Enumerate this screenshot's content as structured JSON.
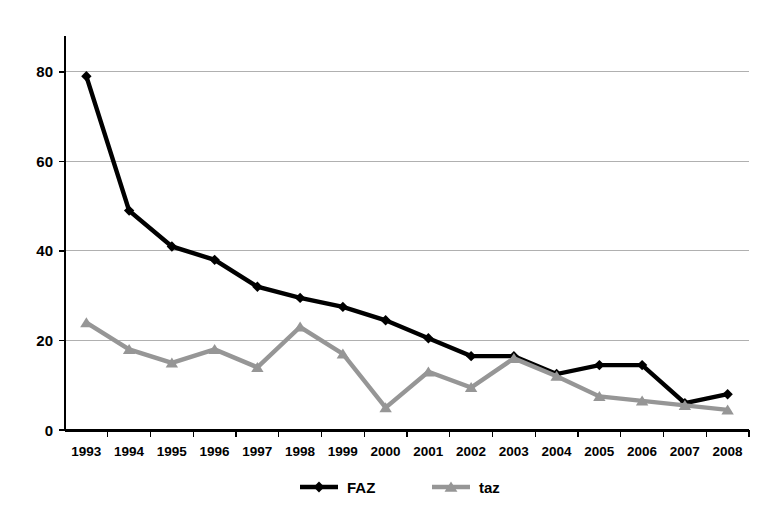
{
  "chart_data": {
    "type": "line",
    "title": "",
    "subtitle": "",
    "xlabel": "",
    "ylabel": "",
    "categories": [
      "1993",
      "1994",
      "1995",
      "1996",
      "1997",
      "1998",
      "1999",
      "2000",
      "2001",
      "2002",
      "2003",
      "2004",
      "2005",
      "2006",
      "2007",
      "2008"
    ],
    "ylim": [
      0,
      88
    ],
    "yticks": [
      0,
      20,
      40,
      60,
      80
    ],
    "ytick_labels": [
      "0",
      "20",
      "40",
      "60",
      "80"
    ],
    "grid": "horizontal",
    "legend_position": "bottom",
    "series": [
      {
        "name": "FAZ",
        "color": "#000000",
        "marker": "diamond",
        "values": [
          79,
          49,
          41,
          38,
          32,
          29.5,
          27.5,
          24.5,
          20.5,
          16.5,
          16.5,
          12.5,
          14.5,
          14.5,
          6,
          8
        ]
      },
      {
        "name": "taz",
        "color": "#969696",
        "marker": "triangle",
        "values": [
          24,
          18,
          15,
          18,
          14,
          23,
          17,
          5,
          13,
          9.5,
          16,
          12,
          7.5,
          6.5,
          5.5,
          4.5
        ]
      }
    ]
  },
  "legend": {
    "items": [
      {
        "label": "FAZ",
        "color": "#000000",
        "marker": "diamond"
      },
      {
        "label": "taz",
        "color": "#969696",
        "marker": "triangle"
      }
    ]
  },
  "axes": {
    "y_axis_name": "value-axis",
    "x_axis_name": "year-axis"
  }
}
